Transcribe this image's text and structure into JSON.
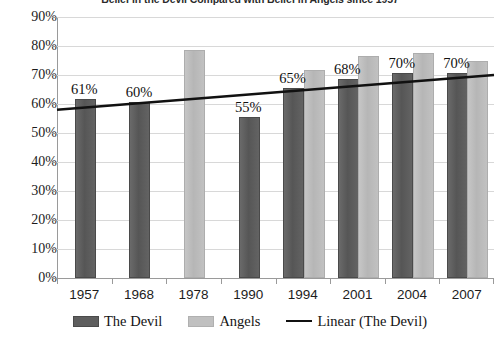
{
  "chart_data": {
    "type": "bar",
    "title": "Belief in the Devil Compared with Belief in Angels since 1957",
    "xlabel": "",
    "ylabel": "",
    "ylim": [
      0,
      90
    ],
    "ytick_step": 10,
    "grid": true,
    "legend_position": "bottom",
    "categories": [
      "1957",
      "1968",
      "1978",
      "1990",
      "1994",
      "2001",
      "2004",
      "2007"
    ],
    "ytick_labels": [
      "90%",
      "80%",
      "70%",
      "60%",
      "50%",
      "40%",
      "30%",
      "20%",
      "10%",
      "0%"
    ],
    "ytick_values": [
      90,
      80,
      70,
      60,
      50,
      40,
      30,
      20,
      10,
      0
    ],
    "series": [
      {
        "name": "The Devil",
        "type": "bar",
        "color": "#5e5e5e",
        "values": [
          61,
          60,
          null,
          55,
          65,
          68,
          70,
          70
        ],
        "data_labels": [
          "61%",
          "60%",
          "",
          "55%",
          "65%",
          "68%",
          "70%",
          "70%"
        ]
      },
      {
        "name": "Angels",
        "type": "bar",
        "color": "#c0c0c0",
        "values": [
          null,
          null,
          78,
          null,
          71,
          76,
          77,
          74
        ],
        "data_labels": [
          "",
          "",
          "",
          "",
          "",
          "",
          "",
          ""
        ]
      },
      {
        "name": "Linear (The Devil)",
        "type": "line",
        "color": "#111111",
        "trend_start": 58,
        "trend_end": 70
      }
    ]
  },
  "legend": {
    "items": [
      {
        "label": "The Devil",
        "marker": "swatch-dark"
      },
      {
        "label": "Angels",
        "marker": "swatch-light"
      },
      {
        "label": "Linear (The Devil)",
        "marker": "line-black"
      }
    ]
  }
}
